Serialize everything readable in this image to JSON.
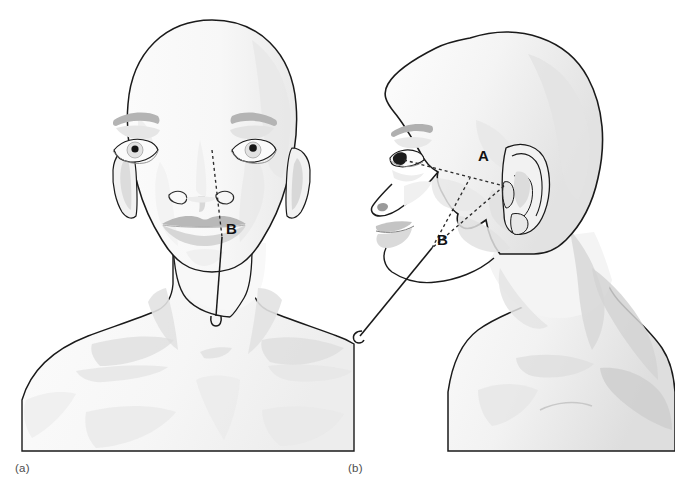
{
  "figure": {
    "background_color": "#ffffff",
    "outline_color": "#1a1a1a",
    "skin_fill": "#fafafa",
    "shade_light": "#f0f0f0",
    "shade_mid": "#e4e4e4",
    "shade_dark": "#d2d2d2",
    "feature_gray": "#b0b0b0",
    "dashed_color": "#2b2b2b",
    "needle_color": "#1a1a1a"
  },
  "panels": [
    {
      "id": "panel-a",
      "caption": "(a)",
      "view": "anterior",
      "description": "Front view of head, neck and upper chest with needle placed along the mid-pupillary line",
      "markers": [
        {
          "label": "B",
          "x": 229,
          "y": 228,
          "meaning": "needle insertion reference point"
        }
      ],
      "guide_lines": [
        {
          "style": "dashed",
          "from": {
            "x": 212,
            "y": 148,
            "anchor": "right-pupil"
          },
          "to": {
            "x": 222,
            "y": 237,
            "anchor": "mid-pupillary-descent"
          }
        }
      ],
      "needle": {
        "style": "solid",
        "from": {
          "x": 222,
          "y": 237
        },
        "to": {
          "x": 215,
          "y": 318
        },
        "hub": {
          "x": 215,
          "y": 322
        }
      }
    },
    {
      "id": "panel-b",
      "caption": "(b)",
      "view": "lateral",
      "description": "Right lateral view of head, neck and shoulder showing dashed triangle between lateral canthus, tragus and insertion point",
      "markers": [
        {
          "label": "A",
          "x": 484,
          "y": 155,
          "meaning": "tragus reference point"
        },
        {
          "label": "B",
          "x": 443,
          "y": 239,
          "meaning": "needle insertion reference point"
        }
      ],
      "guide_lines": [
        {
          "style": "dashed",
          "from": {
            "x": 403,
            "y": 160,
            "anchor": "lateral-canthus"
          },
          "to": {
            "x": 503,
            "y": 185,
            "anchor": "tragus"
          }
        },
        {
          "style": "dashed",
          "from": {
            "x": 503,
            "y": 185,
            "anchor": "tragus"
          },
          "to": {
            "x": 432,
            "y": 248,
            "anchor": "insertion-point"
          }
        },
        {
          "style": "dashed",
          "from": {
            "x": 432,
            "y": 248,
            "anchor": "insertion-point"
          },
          "to": {
            "x": 470,
            "y": 178,
            "anchor": "triangle-vertex"
          }
        }
      ],
      "needle": {
        "style": "solid",
        "from": {
          "x": 432,
          "y": 248
        },
        "to": {
          "x": 358,
          "y": 338
        },
        "hub": {
          "x": 354,
          "y": 342
        }
      }
    }
  ]
}
